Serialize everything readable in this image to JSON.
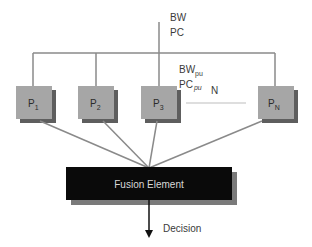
{
  "diagram": {
    "top_labels": {
      "line1": "BW",
      "line2": "PC"
    },
    "pu_labels": {
      "bw": "BW",
      "bw_sub": "pu",
      "pc": "PC",
      "pc_sub": "pu"
    },
    "ellipsis_label": "N",
    "processors": [
      {
        "main": "P",
        "sub": "1"
      },
      {
        "main": "P",
        "sub": "2"
      },
      {
        "main": "P",
        "sub": "3"
      },
      {
        "main": "P",
        "sub": "N"
      }
    ],
    "fusion_label": "Fusion Element",
    "output_label": "Decision",
    "colors": {
      "line": "#8a8a8a",
      "box_fill": "#a6a6a6",
      "box_shadow": "#5e5e5e",
      "fusion_fill": "#0a0a0a",
      "fusion_shadow": "#7a7a7a",
      "arrow": "#111111"
    }
  }
}
